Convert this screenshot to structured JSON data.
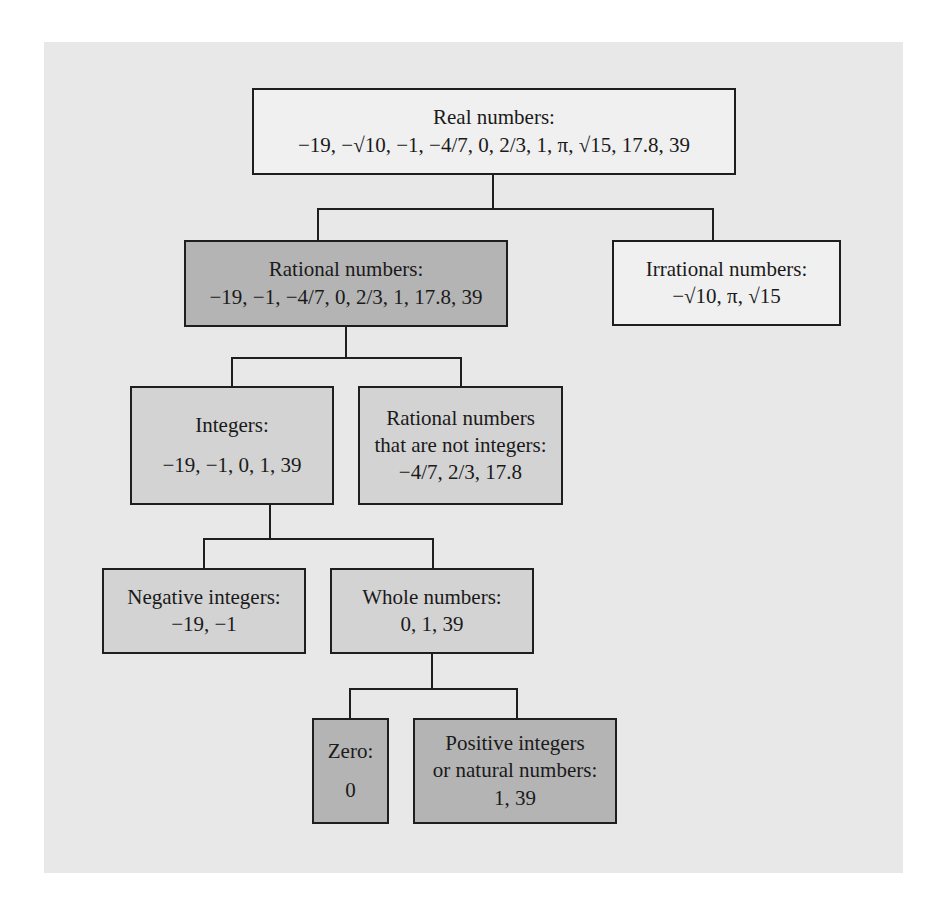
{
  "cutoff_text": "",
  "colors": {
    "panel": "#e8e8e8",
    "white_box": "#f0f0f0",
    "light_box": "#d3d3d3",
    "dark_box": "#b4b4b4",
    "border": "#1e1e1e"
  },
  "nodes": {
    "real": {
      "title": "Real numbers:",
      "values": "−19, −√10, −1, −4/7, 0, 2/3, 1, π, √15, 17.8, 39"
    },
    "rational": {
      "title": "Rational numbers:",
      "values": "−19, −1, −4/7, 0, 2/3, 1, 17.8, 39"
    },
    "irrational": {
      "title": "Irrational numbers:",
      "values": "−√10, π, √15"
    },
    "integers": {
      "title": "Integers:",
      "values": "−19, −1, 0, 1, 39"
    },
    "rational_not_integers": {
      "title_line1": "Rational numbers",
      "title_line2": "that are not integers:",
      "values": "−4/7, 2/3, 17.8"
    },
    "negative_integers": {
      "title": "Negative integers:",
      "values": "−19, −1"
    },
    "whole_numbers": {
      "title": "Whole numbers:",
      "values": "0, 1, 39"
    },
    "zero": {
      "title": "Zero:",
      "values": "0"
    },
    "positive_integers": {
      "title_line1": "Positive integers",
      "title_line2": "or natural numbers:",
      "values": "1, 39"
    }
  }
}
